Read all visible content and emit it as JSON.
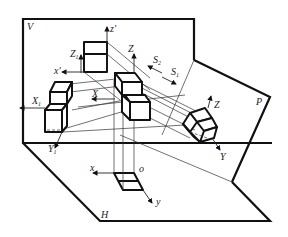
{
  "figure": {
    "type": "axonometric projection principle diagram",
    "planes": [
      {
        "id": "V",
        "label": "V"
      },
      {
        "id": "H",
        "label": "H"
      },
      {
        "id": "P",
        "label": "P"
      }
    ],
    "axis_labels": {
      "z_prime": "z'",
      "x_prime": "x'",
      "x": "x",
      "y": "y",
      "o": "o",
      "Z": "Z",
      "X": "X",
      "Y": "Y",
      "Z1": "Z",
      "Z1_sub": "1",
      "X1": "X",
      "X1_sub": "1",
      "Y1": "Y",
      "Y1_sub": "1"
    },
    "projection_directions": {
      "S1": "S",
      "S1_sub": "1",
      "S2": "S",
      "S2_sub": "2"
    },
    "colors": {
      "line": "#111111",
      "background": "#ffffff"
    }
  }
}
